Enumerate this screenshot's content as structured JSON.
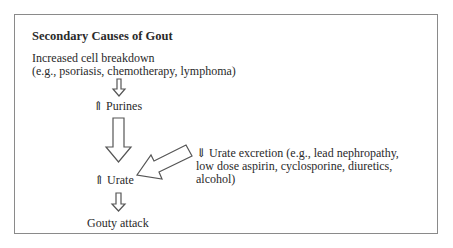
{
  "diagram": {
    "title": "Secondary Causes of Gout",
    "nodes": {
      "cell_breakdown": {
        "line1": "Increased cell breakdown",
        "line2": "(e.g., psoriasis, chemotherapy, lymphoma)"
      },
      "purines": {
        "arrow": "⇑",
        "label": "Purines"
      },
      "urate": {
        "arrow": "⇑",
        "label": "Urate"
      },
      "gouty_attack": {
        "label": "Gouty attack"
      },
      "urate_excretion": {
        "arrow": "⇓",
        "line1": "Urate excretion (e.g., lead nephropathy,",
        "line2": "low dose aspirin, cyclosporine, diuretics,",
        "line3": "alcohol)"
      }
    },
    "edges": [
      {
        "from": "cell_breakdown",
        "to": "purines",
        "style": "hollow-arrow-down"
      },
      {
        "from": "purines",
        "to": "urate",
        "style": "hollow-arrow-down-large"
      },
      {
        "from": "urate_excretion",
        "to": "urate",
        "style": "hollow-arrow-diagonal"
      },
      {
        "from": "urate",
        "to": "gouty_attack",
        "style": "hollow-arrow-down"
      }
    ]
  }
}
